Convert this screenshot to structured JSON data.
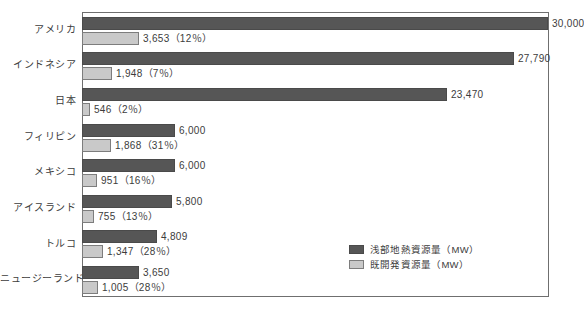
{
  "chart_data": {
    "type": "bar",
    "orientation": "horizontal",
    "title": "",
    "subtitle": "",
    "xlabel": "",
    "ylabel": "",
    "xlim": [
      0,
      30000
    ],
    "grid": false,
    "legend_position": "bottom-right",
    "categories": [
      "アメリカ",
      "インドネシア",
      "日本",
      "フィリピン",
      "メキシコ",
      "アイスランド",
      "トルコ",
      "ニュージーランド"
    ],
    "series": [
      {
        "name": "浅部地熱資源量（MW）",
        "color": "#565656",
        "values": [
          30000,
          27790,
          23470,
          6000,
          6000,
          5800,
          4809,
          3650
        ],
        "labels": [
          "30,000",
          "27,790",
          "23,470",
          "6,000",
          "6,000",
          "5,800",
          "4,809",
          "3,650"
        ]
      },
      {
        "name": "既開発資源量（MW）",
        "color": "#c9c9c9",
        "values": [
          3653,
          1948,
          546,
          1868,
          951,
          755,
          1347,
          1005
        ],
        "percents": [
          "12%",
          "7%",
          "2%",
          "31%",
          "16%",
          "13%",
          "28%",
          "28%"
        ],
        "labels": [
          "3,653（12％）",
          "1,948（7％）",
          "546（2％）",
          "1,868（31％）",
          "951（16％）",
          "755（13％）",
          "1,347（28％）",
          "1,005（28％）"
        ]
      }
    ]
  },
  "legend": {
    "items": [
      {
        "label": "浅部地熱資源量（MW）",
        "color": "#565656"
      },
      {
        "label": "既開発資源量（MW）",
        "color": "#c9c9c9"
      }
    ]
  },
  "style": {
    "frame_color": "#6f6f6f",
    "text_color": "#3c3c3c",
    "background": "#ffffff"
  }
}
